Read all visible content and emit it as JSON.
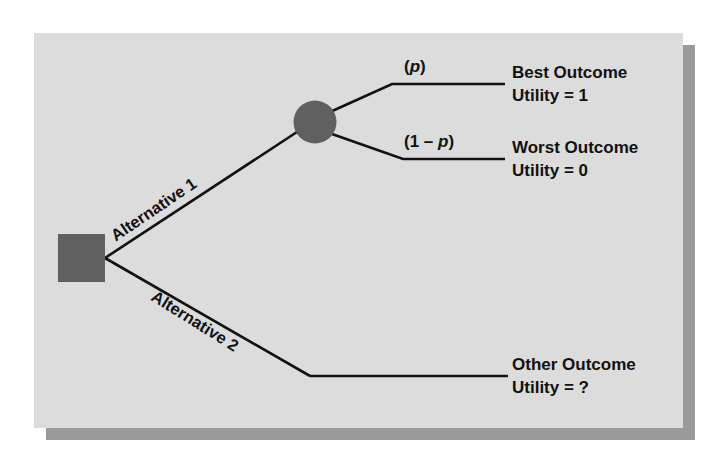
{
  "figure": {
    "type": "decision-tree",
    "panel_color": "#dcdcdc",
    "shadow_color": "#9a9a9a",
    "node_color": "#606060",
    "line_color": "#111111"
  },
  "nodes": {
    "decision": {
      "name": "decision-node",
      "shape": "square"
    },
    "chance": {
      "name": "chance-node",
      "shape": "circle"
    }
  },
  "branches": [
    {
      "label": "Alternative 1"
    },
    {
      "label": "Alternative 2"
    }
  ],
  "probabilities": {
    "upper_open": "(",
    "upper_var": "p",
    "upper_close": ")",
    "lower_open": "(1 – ",
    "lower_var": "p",
    "lower_close": ")"
  },
  "outcomes": [
    {
      "title": "Best Outcome",
      "utility": "Utility = 1"
    },
    {
      "title": "Worst Outcome",
      "utility": "Utility = 0"
    },
    {
      "title": "Other Outcome",
      "utility": "Utility = ?"
    }
  ]
}
